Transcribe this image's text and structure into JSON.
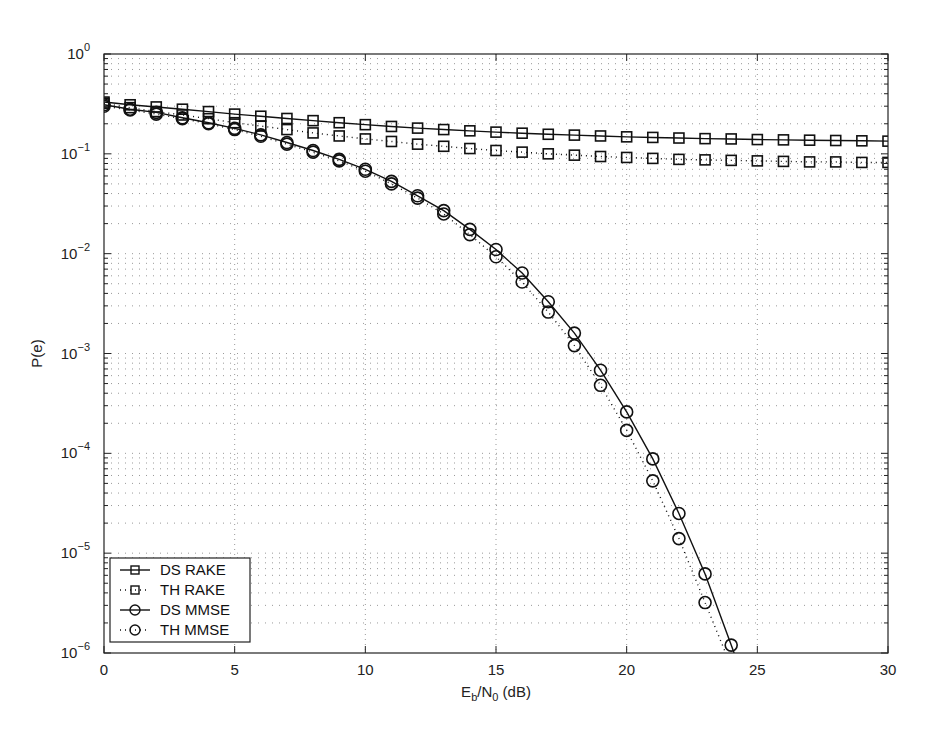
{
  "chart_data": {
    "type": "line",
    "title": "",
    "xlabel": "E_b/N_0 (dB)",
    "ylabel": "P(e)",
    "xscale": "linear",
    "yscale": "log",
    "xlim": [
      0,
      30
    ],
    "ylim": [
      1e-06,
      1
    ],
    "grid": true,
    "legend_position": "lower left",
    "x_ticks": [
      0,
      5,
      10,
      15,
      20,
      25,
      30
    ],
    "y_ticks": [
      "10^0",
      "10^-1",
      "10^-2",
      "10^-3",
      "10^-4",
      "10^-5",
      "10^-6"
    ],
    "series": [
      {
        "name": "DS RAKE",
        "line": "solid",
        "marker": "square",
        "x": [
          0,
          1,
          2,
          3,
          4,
          5,
          6,
          7,
          8,
          9,
          10,
          11,
          12,
          13,
          14,
          15,
          16,
          17,
          18,
          19,
          20,
          21,
          22,
          23,
          24,
          25,
          26,
          27,
          28,
          29,
          30
        ],
        "values": [
          0.33,
          0.31,
          0.295,
          0.28,
          0.265,
          0.25,
          0.238,
          0.226,
          0.215,
          0.205,
          0.196,
          0.188,
          0.181,
          0.175,
          0.17,
          0.165,
          0.161,
          0.157,
          0.154,
          0.151,
          0.148,
          0.146,
          0.144,
          0.142,
          0.141,
          0.139,
          0.138,
          0.137,
          0.136,
          0.135,
          0.134
        ]
      },
      {
        "name": "TH RAKE",
        "line": "dotted",
        "marker": "square",
        "x": [
          0,
          1,
          2,
          3,
          4,
          5,
          6,
          7,
          8,
          9,
          10,
          11,
          12,
          13,
          14,
          15,
          16,
          17,
          18,
          19,
          20,
          21,
          22,
          23,
          24,
          25,
          26,
          27,
          28,
          29,
          30
        ],
        "values": [
          0.32,
          0.29,
          0.265,
          0.245,
          0.225,
          0.205,
          0.19,
          0.175,
          0.162,
          0.151,
          0.141,
          0.133,
          0.125,
          0.119,
          0.113,
          0.108,
          0.104,
          0.1,
          0.097,
          0.094,
          0.092,
          0.09,
          0.088,
          0.087,
          0.086,
          0.085,
          0.084,
          0.083,
          0.083,
          0.082,
          0.082
        ]
      },
      {
        "name": "DS MMSE",
        "line": "solid",
        "marker": "circle",
        "x": [
          0,
          1,
          2,
          3,
          4,
          5,
          6,
          7,
          8,
          9,
          10,
          11,
          12,
          13,
          14,
          15,
          16,
          17,
          18,
          19,
          20,
          21,
          22,
          23,
          24
        ],
        "values": [
          0.31,
          0.28,
          0.26,
          0.23,
          0.205,
          0.18,
          0.155,
          0.13,
          0.108,
          0.088,
          0.07,
          0.053,
          0.038,
          0.027,
          0.0175,
          0.011,
          0.0064,
          0.0033,
          0.0016,
          0.00068,
          0.00026,
          8.8e-05,
          2.5e-05,
          6.2e-06,
          1.2e-06
        ]
      },
      {
        "name": "TH MMSE",
        "line": "dotted",
        "marker": "circle",
        "x": [
          0,
          1,
          2,
          3,
          4,
          5,
          6,
          7,
          8,
          9,
          10,
          11,
          12,
          13,
          14,
          15,
          16,
          17,
          18,
          19,
          20,
          21,
          22,
          23
        ],
        "values": [
          0.3,
          0.275,
          0.25,
          0.225,
          0.2,
          0.175,
          0.15,
          0.125,
          0.104,
          0.085,
          0.067,
          0.05,
          0.036,
          0.025,
          0.0155,
          0.0093,
          0.0052,
          0.0026,
          0.0012,
          0.00048,
          0.00017,
          5.3e-05,
          1.4e-05,
          3.2e-06
        ]
      }
    ]
  },
  "labels": {
    "ylabel": "P(e)",
    "xlabel_main": "E",
    "xlabel_sub1": "b",
    "xlabel_mid": "/N",
    "xlabel_sub2": "0",
    "xlabel_tail": " (dB)"
  },
  "legend": [
    "DS RAKE",
    "TH RAKE",
    "DS MMSE",
    "TH MMSE"
  ]
}
